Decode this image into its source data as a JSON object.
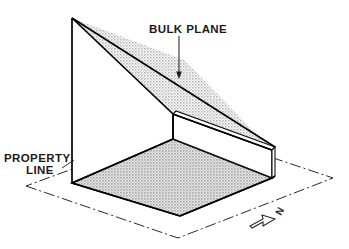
{
  "diagram": {
    "type": "axonometric-line-drawing",
    "background_color": "#ffffff",
    "line_color": "#000000",
    "fill_color": "#c9c9c9",
    "labels": {
      "bulk_plane": "BULK PLANE",
      "property_line_1": "PROPERTY",
      "property_line_2": "LINE",
      "north": "N"
    },
    "icons": {
      "leader_arrow": "arrow-down-icon",
      "north_arrow": "north-arrow-icon"
    },
    "geometry": {
      "apex": [
        72,
        18
      ],
      "wall_base_left": [
        72,
        183
      ],
      "floor_front": [
        180,
        216
      ],
      "floor_right": [
        272,
        178
      ],
      "floor_back": [
        173,
        139
      ],
      "low_wall_top_right": [
        272,
        150
      ],
      "low_wall_top_inner": [
        173,
        114
      ],
      "plane_right_tip": [
        272,
        150
      ],
      "property_quad": [
        [
          26,
          186
        ],
        [
          178,
          238
        ],
        [
          333,
          178
        ],
        [
          184,
          128
        ]
      ]
    }
  }
}
